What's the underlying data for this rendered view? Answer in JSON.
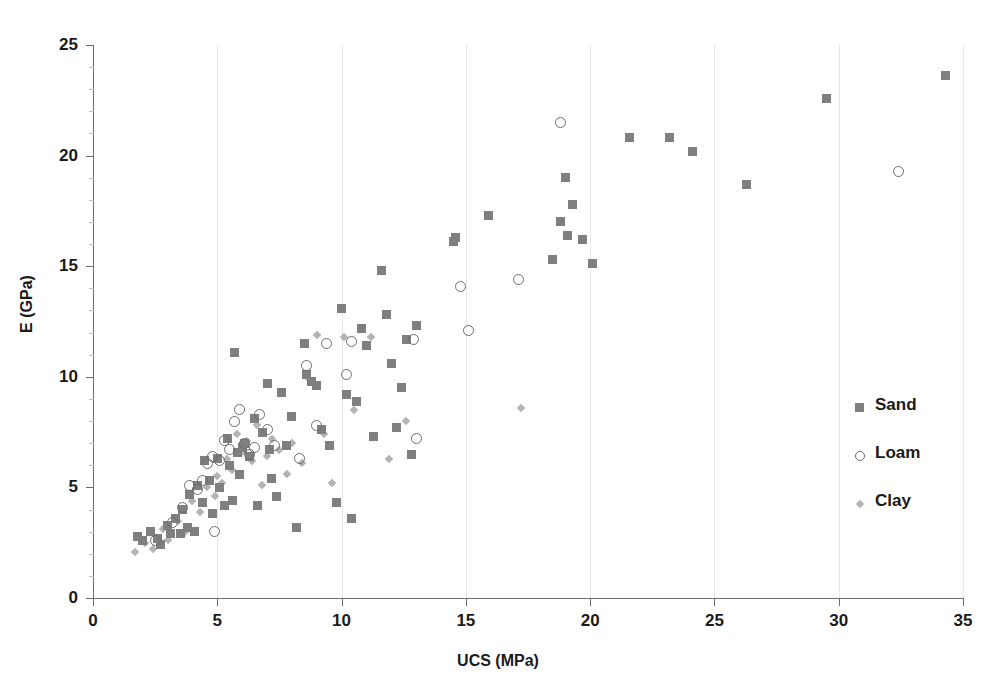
{
  "chart_data": {
    "type": "scatter",
    "title": "",
    "xlabel": "UCS (MPa)",
    "ylabel": "E (GPa)",
    "xlim": [
      0,
      35
    ],
    "ylim": [
      0,
      25
    ],
    "xticks": [
      0,
      5,
      10,
      15,
      20,
      25,
      30,
      35
    ],
    "yticks": [
      0,
      5,
      10,
      15,
      20,
      25
    ],
    "grid": "vertical-major-only",
    "legend_position": "right-middle",
    "colors": {
      "sand": "#7f7f7f",
      "loam": "#6d6d6d",
      "clay": "#b3b3b3",
      "axis": "#6e6e6e",
      "gridline": "#e8e8e8",
      "background": "#ffffff"
    },
    "series": [
      {
        "name": "Sand",
        "marker": "filled-square",
        "points": [
          [
            1.8,
            2.8
          ],
          [
            2.0,
            2.6
          ],
          [
            2.3,
            3.0
          ],
          [
            2.6,
            2.7
          ],
          [
            2.7,
            2.4
          ],
          [
            3.0,
            3.3
          ],
          [
            3.1,
            2.9
          ],
          [
            3.3,
            3.6
          ],
          [
            3.5,
            2.9
          ],
          [
            3.6,
            4.0
          ],
          [
            3.8,
            3.2
          ],
          [
            3.9,
            4.7
          ],
          [
            4.1,
            3.0
          ],
          [
            4.2,
            5.1
          ],
          [
            4.4,
            4.3
          ],
          [
            4.5,
            6.2
          ],
          [
            4.7,
            5.3
          ],
          [
            4.8,
            3.8
          ],
          [
            5.0,
            6.3
          ],
          [
            5.1,
            5.0
          ],
          [
            5.3,
            4.2
          ],
          [
            5.4,
            7.2
          ],
          [
            5.5,
            6.0
          ],
          [
            5.6,
            4.4
          ],
          [
            5.7,
            11.1
          ],
          [
            5.8,
            6.6
          ],
          [
            5.9,
            5.6
          ],
          [
            6.0,
            6.8
          ],
          [
            6.1,
            7.0
          ],
          [
            6.3,
            6.4
          ],
          [
            6.5,
            8.1
          ],
          [
            6.6,
            4.2
          ],
          [
            6.8,
            7.5
          ],
          [
            7.0,
            9.7
          ],
          [
            7.1,
            6.7
          ],
          [
            7.2,
            5.4
          ],
          [
            7.4,
            4.6
          ],
          [
            7.6,
            9.3
          ],
          [
            7.8,
            6.9
          ],
          [
            8.0,
            8.2
          ],
          [
            8.2,
            3.2
          ],
          [
            8.5,
            11.5
          ],
          [
            8.6,
            10.1
          ],
          [
            8.8,
            9.8
          ],
          [
            9.0,
            9.6
          ],
          [
            9.2,
            7.6
          ],
          [
            9.5,
            6.9
          ],
          [
            9.8,
            4.3
          ],
          [
            10.0,
            13.1
          ],
          [
            10.2,
            9.2
          ],
          [
            10.4,
            3.6
          ],
          [
            10.6,
            8.9
          ],
          [
            10.8,
            12.2
          ],
          [
            11.0,
            11.4
          ],
          [
            11.3,
            7.3
          ],
          [
            11.6,
            14.8
          ],
          [
            11.8,
            12.8
          ],
          [
            12.0,
            10.6
          ],
          [
            12.2,
            7.7
          ],
          [
            12.4,
            9.5
          ],
          [
            12.6,
            11.7
          ],
          [
            12.8,
            6.5
          ],
          [
            13.0,
            12.3
          ],
          [
            14.5,
            16.1
          ],
          [
            14.6,
            16.3
          ],
          [
            15.9,
            17.3
          ],
          [
            18.5,
            15.3
          ],
          [
            18.8,
            17.0
          ],
          [
            19.0,
            19.0
          ],
          [
            19.1,
            16.4
          ],
          [
            19.3,
            17.8
          ],
          [
            19.7,
            16.2
          ],
          [
            20.1,
            15.1
          ],
          [
            21.6,
            20.8
          ],
          [
            23.2,
            20.8
          ],
          [
            24.1,
            20.2
          ],
          [
            26.3,
            18.7
          ],
          [
            29.5,
            22.6
          ],
          [
            34.3,
            23.6
          ]
        ]
      },
      {
        "name": "Loam",
        "marker": "open-circle",
        "points": [
          [
            2.5,
            2.6
          ],
          [
            3.2,
            3.4
          ],
          [
            3.6,
            4.1
          ],
          [
            3.9,
            5.1
          ],
          [
            4.2,
            4.9
          ],
          [
            4.4,
            5.3
          ],
          [
            4.6,
            6.1
          ],
          [
            4.8,
            6.4
          ],
          [
            4.9,
            3.0
          ],
          [
            5.1,
            6.2
          ],
          [
            5.3,
            7.1
          ],
          [
            5.5,
            6.7
          ],
          [
            5.7,
            8.0
          ],
          [
            5.9,
            8.5
          ],
          [
            6.1,
            7.0
          ],
          [
            6.3,
            6.5
          ],
          [
            6.5,
            6.8
          ],
          [
            6.7,
            8.3
          ],
          [
            7.0,
            7.6
          ],
          [
            7.3,
            6.9
          ],
          [
            8.3,
            6.3
          ],
          [
            8.6,
            10.5
          ],
          [
            9.0,
            7.8
          ],
          [
            9.4,
            11.5
          ],
          [
            10.2,
            10.1
          ],
          [
            10.4,
            11.6
          ],
          [
            12.9,
            11.7
          ],
          [
            13.0,
            7.2
          ],
          [
            15.1,
            12.1
          ],
          [
            14.8,
            14.1
          ],
          [
            17.1,
            14.4
          ],
          [
            18.8,
            21.5
          ],
          [
            32.4,
            19.3
          ]
        ]
      },
      {
        "name": "Clay",
        "marker": "small-diamond",
        "points": [
          [
            1.7,
            2.1
          ],
          [
            2.1,
            2.5
          ],
          [
            2.4,
            2.2
          ],
          [
            2.8,
            3.1
          ],
          [
            3.0,
            2.6
          ],
          [
            3.4,
            3.5
          ],
          [
            3.7,
            3.0
          ],
          [
            4.0,
            4.4
          ],
          [
            4.3,
            3.9
          ],
          [
            4.6,
            5.0
          ],
          [
            4.9,
            4.6
          ],
          [
            5.0,
            5.5
          ],
          [
            5.2,
            5.2
          ],
          [
            5.4,
            6.3
          ],
          [
            5.6,
            5.8
          ],
          [
            5.8,
            7.4
          ],
          [
            6.0,
            6.6
          ],
          [
            6.2,
            7.1
          ],
          [
            6.4,
            6.2
          ],
          [
            6.6,
            7.8
          ],
          [
            6.8,
            5.1
          ],
          [
            7.0,
            6.4
          ],
          [
            7.2,
            7.2
          ],
          [
            7.5,
            6.7
          ],
          [
            7.8,
            5.6
          ],
          [
            8.0,
            7.0
          ],
          [
            8.4,
            6.1
          ],
          [
            8.7,
            9.9
          ],
          [
            9.0,
            11.9
          ],
          [
            9.3,
            7.4
          ],
          [
            9.6,
            5.2
          ],
          [
            10.1,
            11.8
          ],
          [
            10.5,
            8.5
          ],
          [
            11.2,
            11.8
          ],
          [
            11.9,
            6.3
          ],
          [
            12.6,
            8.0
          ],
          [
            17.2,
            8.6
          ]
        ]
      }
    ]
  },
  "legend": {
    "items": [
      {
        "label": "Sand",
        "marker": "filled-square"
      },
      {
        "label": "Loam",
        "marker": "open-circle"
      },
      {
        "label": "Clay",
        "marker": "small-diamond"
      }
    ]
  },
  "axes": {
    "x": {
      "title": "UCS (MPa)",
      "tick_labels": [
        "0",
        "5",
        "10",
        "15",
        "20",
        "25",
        "30",
        "35"
      ]
    },
    "y": {
      "title": "E (GPa)",
      "tick_labels": [
        "0",
        "5",
        "10",
        "15",
        "20",
        "25"
      ]
    }
  }
}
